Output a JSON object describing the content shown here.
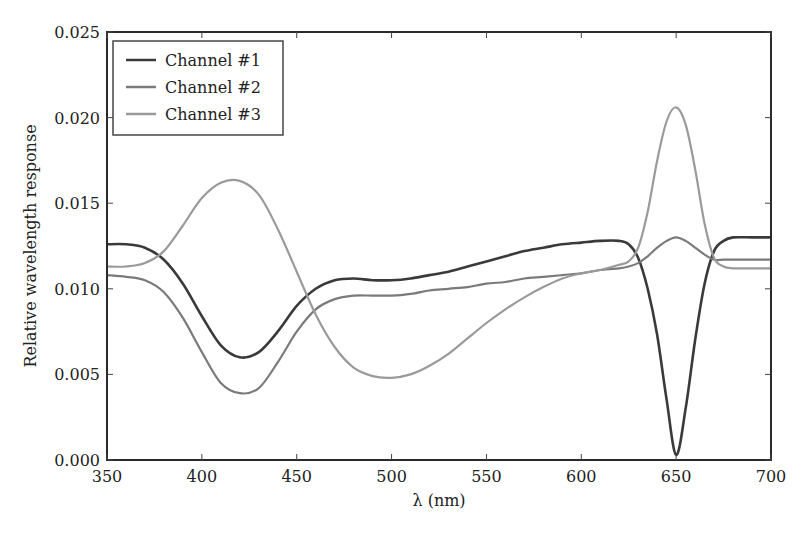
{
  "chart_data": {
    "type": "line",
    "title": "",
    "xlabel": "λ (nm)",
    "ylabel": "Relative wavelength response",
    "xlim": [
      350,
      700
    ],
    "ylim": [
      0.0,
      0.025
    ],
    "xticks": [
      350,
      400,
      450,
      500,
      550,
      600,
      650,
      700
    ],
    "xtick_labels": [
      "350",
      "400",
      "450",
      "500",
      "550",
      "600",
      "650",
      "700"
    ],
    "yticks": [
      0.0,
      0.005,
      0.01,
      0.015,
      0.02,
      0.025
    ],
    "ytick_labels": [
      "0.000",
      "0.005",
      "0.010",
      "0.015",
      "0.020",
      "0.025"
    ],
    "grid": false,
    "legend_position": "upper left",
    "x": [
      350,
      360,
      370,
      380,
      390,
      400,
      410,
      420,
      430,
      440,
      450,
      460,
      470,
      480,
      490,
      500,
      510,
      520,
      530,
      540,
      550,
      560,
      570,
      580,
      590,
      600,
      610,
      620,
      625,
      630,
      635,
      640,
      645,
      650,
      655,
      660,
      665,
      670,
      675,
      680,
      690,
      700
    ],
    "series": [
      {
        "name": "Channel #1",
        "color": "#3a3a3a",
        "values": [
          0.0126,
          0.0126,
          0.0124,
          0.0117,
          0.0103,
          0.0084,
          0.0067,
          0.006,
          0.0063,
          0.0075,
          0.009,
          0.01,
          0.0105,
          0.0106,
          0.0105,
          0.0105,
          0.0106,
          0.0108,
          0.011,
          0.0113,
          0.0116,
          0.0119,
          0.0122,
          0.0124,
          0.0126,
          0.0127,
          0.0128,
          0.0128,
          0.0126,
          0.0118,
          0.01,
          0.0073,
          0.0035,
          0.0003,
          0.003,
          0.007,
          0.0103,
          0.0122,
          0.0128,
          0.013,
          0.013,
          0.013
        ]
      },
      {
        "name": "Channel #2",
        "color": "#7a7a7a",
        "values": [
          0.0108,
          0.0107,
          0.0105,
          0.0098,
          0.0083,
          0.0063,
          0.0045,
          0.0039,
          0.0042,
          0.0057,
          0.0075,
          0.0088,
          0.0094,
          0.0096,
          0.0096,
          0.0096,
          0.0097,
          0.0099,
          0.01,
          0.0101,
          0.0103,
          0.0104,
          0.0106,
          0.0107,
          0.0108,
          0.0109,
          0.0111,
          0.0112,
          0.0113,
          0.0115,
          0.0119,
          0.0124,
          0.0128,
          0.013,
          0.0128,
          0.0124,
          0.012,
          0.0117,
          0.0117,
          0.0117,
          0.0117,
          0.0117
        ]
      },
      {
        "name": "Channel #3",
        "color": "#9a9a9a",
        "values": [
          0.0113,
          0.0113,
          0.0115,
          0.0122,
          0.0137,
          0.0153,
          0.0162,
          0.0163,
          0.0155,
          0.0135,
          0.011,
          0.0085,
          0.0066,
          0.0054,
          0.0049,
          0.0048,
          0.005,
          0.0055,
          0.0062,
          0.0071,
          0.008,
          0.0088,
          0.0095,
          0.0101,
          0.0106,
          0.0109,
          0.0111,
          0.0114,
          0.0116,
          0.0124,
          0.0145,
          0.0175,
          0.0198,
          0.0206,
          0.0196,
          0.017,
          0.0138,
          0.0118,
          0.0113,
          0.0112,
          0.0112,
          0.0112
        ]
      }
    ]
  },
  "legend": {
    "items": [
      {
        "label": "Channel #1",
        "color": "#3a3a3a"
      },
      {
        "label": "Channel #2",
        "color": "#7a7a7a"
      },
      {
        "label": "Channel #3",
        "color": "#9a9a9a"
      }
    ]
  }
}
